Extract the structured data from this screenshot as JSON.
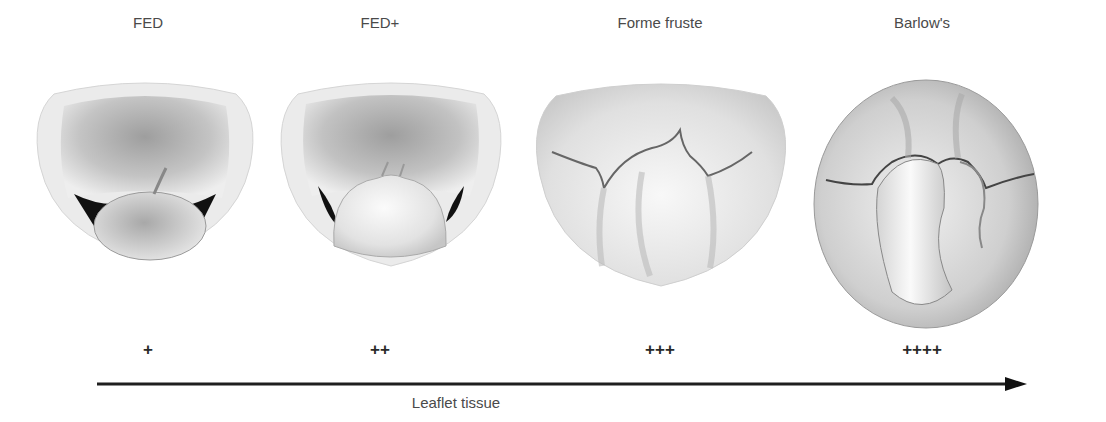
{
  "diagram": {
    "stages": [
      {
        "label": "FED",
        "grade": "+",
        "center_x": 148
      },
      {
        "label": "FED+",
        "grade": "++",
        "center_x": 380
      },
      {
        "label": "Forme fruste",
        "grade": "+++",
        "center_x": 660
      },
      {
        "label": "Barlow's",
        "grade": "++++",
        "center_x": 922
      }
    ],
    "axis": {
      "label": "Leaflet tissue",
      "direction": "increasing-right"
    },
    "colors": {
      "arrow": "#1a1a1a",
      "valve_light": "#f2f2f2",
      "valve_mid": "#b8b8b8",
      "valve_dark": "#7a7a7a",
      "shadow": "#111111"
    }
  }
}
